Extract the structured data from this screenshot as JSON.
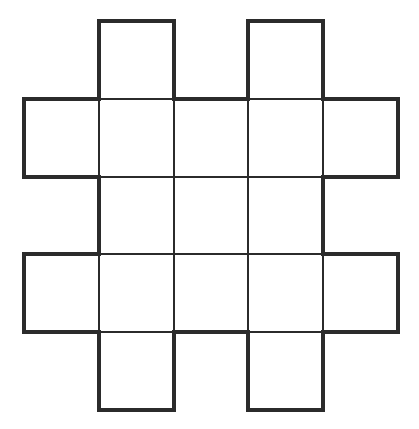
{
  "diagram": {
    "type": "grid-shape",
    "columns_x": [
      24,
      99,
      174,
      248,
      323,
      398
    ],
    "rows_y": [
      21,
      99,
      177,
      254,
      332,
      410
    ],
    "cells": [
      [
        0,
        1,
        0,
        1,
        0
      ],
      [
        1,
        1,
        1,
        1,
        1
      ],
      [
        0,
        1,
        1,
        1,
        0
      ],
      [
        1,
        1,
        1,
        1,
        1
      ],
      [
        0,
        1,
        0,
        1,
        0
      ]
    ],
    "line_color": "#2b2b2b",
    "outline_width": 4,
    "inner_width": 2
  }
}
